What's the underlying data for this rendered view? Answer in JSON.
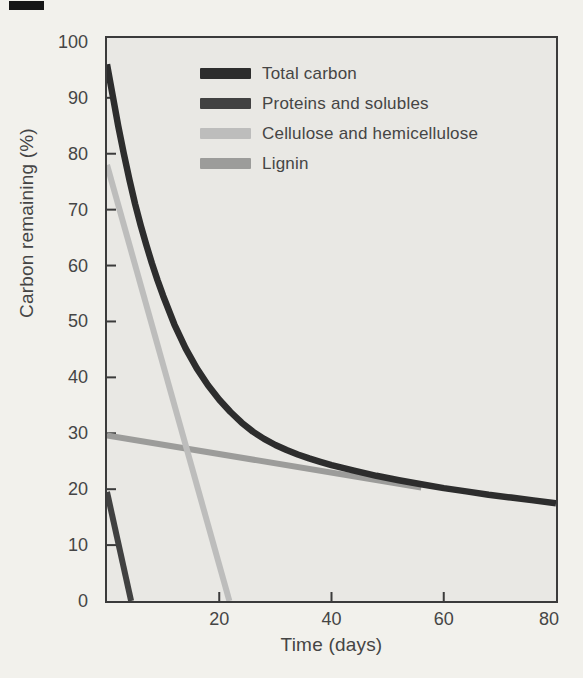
{
  "chart_data": {
    "type": "line",
    "title": "",
    "xlabel": "Time (days)",
    "ylabel": "Carbon remaining (%)",
    "xlim": [
      0,
      80
    ],
    "ylim": [
      0,
      100.7
    ],
    "xticks": [
      20,
      40,
      60,
      80
    ],
    "yticks": [
      0,
      10,
      20,
      30,
      40,
      50,
      60,
      70,
      80,
      90,
      100
    ],
    "grid": false,
    "legend_position": "top-center-inside",
    "style": {
      "page_background": "#f2f1ec",
      "plot_background": "#e9e8e4",
      "axis_color": "#3b3b3b",
      "text_color": "#454545",
      "tick_length": 9,
      "tick_direction": "in"
    },
    "series": [
      {
        "name": "Total carbon",
        "color": "#2d2d2d",
        "width": 6.5,
        "x": [
          0,
          1,
          2,
          3,
          4,
          5,
          6,
          7,
          8,
          9,
          10,
          12,
          14,
          16,
          18,
          20,
          22,
          24,
          26,
          28,
          30,
          32,
          34,
          36,
          38,
          40,
          44,
          48,
          52,
          56,
          60,
          64,
          68,
          72,
          76,
          80
        ],
        "y": [
          96,
          90.5,
          85,
          80,
          75.3,
          71,
          67.2,
          63.7,
          60.4,
          57.4,
          54.6,
          49.5,
          45.2,
          41.6,
          38.6,
          36,
          33.8,
          31.9,
          30.3,
          29,
          27.9,
          27,
          26.2,
          25.5,
          24.9,
          24.3,
          23.3,
          22.4,
          21.6,
          20.9,
          20.2,
          19.6,
          19,
          18.5,
          18,
          17.5
        ]
      },
      {
        "name": "Proteins and solubles",
        "color": "#414141",
        "width": 6,
        "x": [
          0,
          4.3
        ],
        "y": [
          19.5,
          0
        ]
      },
      {
        "name": "Cellulose and hemicellulose",
        "color": "#bdbdbc",
        "width": 6,
        "x": [
          0,
          21.8
        ],
        "y": [
          78,
          0
        ]
      },
      {
        "name": "Lignin",
        "color": "#9c9c9a",
        "width": 6,
        "x": [
          0,
          56
        ],
        "y": [
          29.6,
          20.3
        ]
      }
    ]
  }
}
